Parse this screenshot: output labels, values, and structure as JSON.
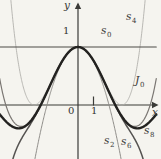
{
  "figure": {
    "background_color": "#f5f4ef"
  },
  "chart_data": {
    "type": "line",
    "title": "",
    "xlabel": "x",
    "ylabel": "y",
    "grid": false,
    "legend_position": "inline-curve-labels",
    "x_range": [
      -5.05,
      5.06
    ],
    "y_range": [
      -0.93,
      1.81
    ],
    "axes": {
      "color": "#3a3a37",
      "width": 1.2,
      "origin_px": {
        "x": 78,
        "y": 105
      },
      "px_per_unit": {
        "x": 15.5,
        "y": 58
      },
      "x_axis_px": {
        "x1": 0,
        "x2": 152.5
      },
      "y_axis_px": {
        "y1": 4,
        "y2": 159
      },
      "x_arrow_tip_px": {
        "x": 158.5,
        "y": 105
      },
      "y_arrow_tip_px": {
        "x": 78,
        "y": 2.5
      },
      "tick_x1_px": {
        "x": 93.5,
        "y1": 96.5,
        "y2": 105.5
      }
    },
    "function_family": "s_k(x) = sum_{n=0}^{k/2} (-1)^n x^(2n) / (4^n (n!)^2);  J0 = limit k->infinity",
    "key_features": {
      "all_curves_pass_through": [
        0,
        1
      ],
      "J0_first_zeros_x": [
        -2.405,
        2.405
      ],
      "J0_local_minima": [
        [
          -3.83,
          -0.403
        ],
        [
          3.83,
          -0.403
        ]
      ],
      "s4_touches_x_axis_at": [
        -2.828,
        2.828
      ],
      "s2_zeros_x": [
        -2,
        2
      ]
    },
    "x_ticks": [
      {
        "value": 1,
        "label": "1"
      }
    ],
    "y_ticks": [
      {
        "value": 1,
        "label": "1"
      }
    ],
    "axis_labels": {
      "y": {
        "text": "y",
        "px": {
          "x": 64,
          "y": 0
        }
      },
      "x": {
        "text": "x",
        "px": {
          "x": 152,
          "y": 107
        }
      },
      "origin": {
        "text": "0",
        "px": {
          "x": 68,
          "y": 106
        }
      },
      "tick_1_x": {
        "text": "1",
        "px": {
          "x": 91,
          "y": 106
        }
      },
      "tick_1_y": {
        "text": "1",
        "px": {
          "x": 63,
          "y": 26
        }
      }
    },
    "series": [
      {
        "id": "s4",
        "label": {
          "main": "s",
          "sub": "4"
        },
        "terms": 3,
        "degree": 4,
        "color": "#b2b1ad",
        "width": 0.9,
        "label_px": {
          "x": 126,
          "y": 11
        }
      },
      {
        "id": "s2",
        "label": {
          "main": "s",
          "sub": "2"
        },
        "terms": 2,
        "degree": 2,
        "color": "#8e8c88",
        "width": 1.0,
        "label_px": {
          "x": 104,
          "y": 135
        }
      },
      {
        "id": "s8",
        "label": {
          "main": "s",
          "sub": "8"
        },
        "terms": 5,
        "degree": 8,
        "color": "#7a7672",
        "width": 1.2,
        "label_px": {
          "x": 144,
          "y": 125
        }
      },
      {
        "id": "s6",
        "label": {
          "main": "s",
          "sub": "6"
        },
        "terms": 4,
        "degree": 6,
        "color": "#545250",
        "width": 1.5,
        "label_px": {
          "x": 121,
          "y": 136
        }
      },
      {
        "id": "s0",
        "label": {
          "main": "s",
          "sub": "0"
        },
        "terms": 1,
        "degree": 0,
        "color": "#4c4a47",
        "width": 1.1,
        "label_px": {
          "x": 101,
          "y": 25
        }
      },
      {
        "id": "J0",
        "label": {
          "main": "J",
          "sub": "0"
        },
        "terms": 13,
        "degree": "infinity",
        "color": "#232220",
        "width": 2.4,
        "label_px": {
          "x": 135,
          "y": 75
        }
      }
    ]
  }
}
